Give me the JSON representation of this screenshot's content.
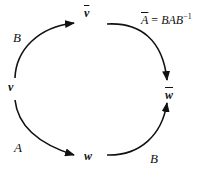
{
  "diagram": {
    "type": "commutative-diagram",
    "nodes": {
      "v": "v",
      "v_bar": "v",
      "w": "w",
      "w_bar": "w"
    },
    "edges": [
      {
        "from": "v",
        "to": "v_bar",
        "label": "B"
      },
      {
        "from": "v",
        "to": "w",
        "label": "A"
      },
      {
        "from": "w",
        "to": "w_bar",
        "label": "B"
      },
      {
        "from": "v_bar",
        "to": "w_bar",
        "label": "A_bar"
      }
    ],
    "labels": {
      "edge_B_top": "B",
      "edge_A_left": "A",
      "edge_B_bottom": "B"
    },
    "equation": {
      "lhs": "A",
      "equals": " = ",
      "rhs": "BAB",
      "exponent": "−1"
    },
    "colors": {
      "stroke": "#111111",
      "background": "#ffffff"
    }
  }
}
